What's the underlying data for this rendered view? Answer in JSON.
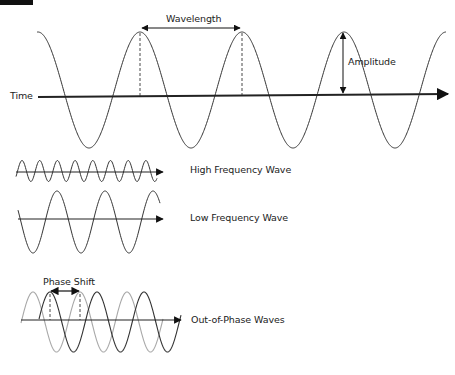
{
  "diagram": {
    "title_bar_color": "#111111",
    "main_wave": {
      "axis_label": "Time",
      "wavelength_label": "Wavelength",
      "amplitude_label": "Amplitude",
      "line_color": "#333333",
      "axis_color": "#222222"
    },
    "high_frequency": {
      "label": "High Frequency Wave",
      "cycles": 8
    },
    "low_frequency": {
      "label": "Low Frequency Wave",
      "cycles": 3
    },
    "out_of_phase": {
      "label": "Out-of-Phase Waves",
      "phase_shift_label": "Phase Shift",
      "wave_a_color": "#a8a8a8",
      "wave_b_color": "#333333"
    }
  }
}
